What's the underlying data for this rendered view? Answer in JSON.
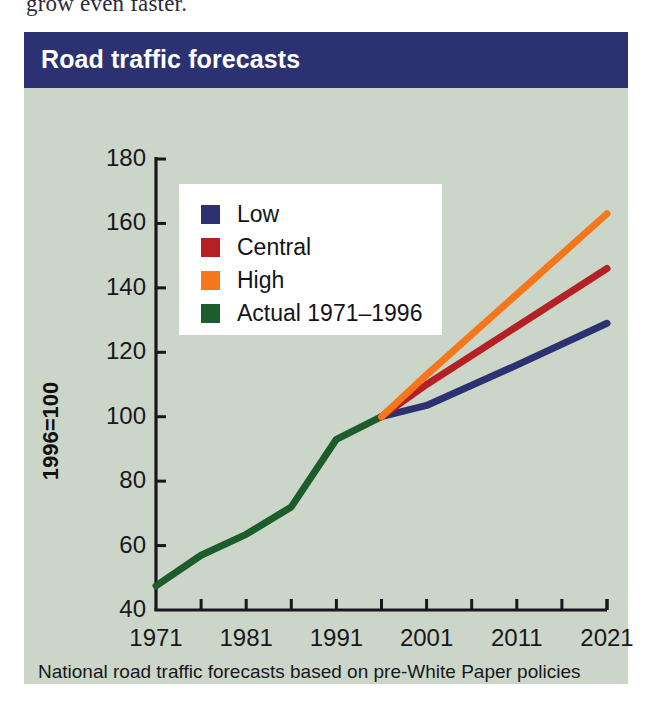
{
  "page_top_text": "grow even faster.",
  "figure": {
    "title": "Road traffic forecasts",
    "caption": "National road traffic forecasts based on pre-White Paper policies",
    "background_color": "#ccd6c8",
    "title_bar_color": "#2c3171"
  },
  "legend": {
    "items": [
      {
        "label": "Low",
        "color": "#2c3171"
      },
      {
        "label": "Central",
        "color": "#b52025"
      },
      {
        "label": "High",
        "color": "#f6761b"
      },
      {
        "label": "Actual 1971–1996",
        "color": "#1d5c2c"
      }
    ]
  },
  "chart_data": {
    "type": "line",
    "title": "Road traffic forecasts",
    "xlabel": "",
    "ylabel": "1996=100",
    "xlim": [
      1971,
      2021
    ],
    "ylim": [
      40,
      180
    ],
    "grid": false,
    "legend_position": "upper-left-inset",
    "xticks": [
      1971,
      1981,
      1991,
      2001,
      2011,
      2021
    ],
    "xtick_labels": [
      "1971",
      "1981",
      "1991",
      "2001",
      "2011",
      "2021"
    ],
    "xminor_ticks": [
      1976,
      1986,
      1996,
      2006,
      2016
    ],
    "yticks": [
      40,
      60,
      80,
      100,
      120,
      140,
      160,
      180
    ],
    "ytick_labels": [
      "40",
      "60",
      "80",
      "100",
      "120",
      "140",
      "160",
      "180"
    ],
    "series": [
      {
        "name": "Actual 1971–1996",
        "color": "#1d5c2c",
        "x": [
          1971,
          1976,
          1981,
          1986,
          1991,
          1996
        ],
        "values": [
          47.5,
          57,
          63.5,
          72,
          93,
          100
        ]
      },
      {
        "name": "Low",
        "color": "#2c3171",
        "x": [
          1996,
          2001,
          2011,
          2021
        ],
        "values": [
          100,
          103.5,
          116,
          129
        ]
      },
      {
        "name": "Central",
        "color": "#b52025",
        "x": [
          1996,
          2001,
          2011,
          2021
        ],
        "values": [
          100,
          110,
          128,
          146
        ]
      },
      {
        "name": "High",
        "color": "#f6761b",
        "x": [
          1996,
          2001,
          2011,
          2021
        ],
        "values": [
          100,
          113,
          138,
          163
        ]
      }
    ]
  }
}
